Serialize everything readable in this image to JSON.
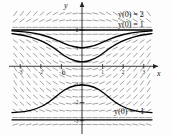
{
  "figure": {
    "title": "",
    "axis_labels": {
      "x": "x",
      "y": "y"
    },
    "origin_label": "0"
  },
  "annotations": [
    {
      "id": "ic-2",
      "text": "y(0) = 2"
    },
    {
      "id": "ic-1",
      "text": "y(0) = 1"
    },
    {
      "id": "ic-m1",
      "text": "y(0) = −1"
    }
  ],
  "chart_data": {
    "type": "line",
    "title": "",
    "xlabel": "x",
    "ylabel": "y",
    "xlim": [
      -3.4,
      3.4
    ],
    "ylim": [
      -3.4,
      3.1
    ],
    "grid": false,
    "legend_position": "right-inline",
    "xticks": [
      -3,
      -2,
      -1,
      0,
      1,
      2,
      3
    ],
    "yticks": [
      -3,
      -2,
      -1,
      1,
      2
    ],
    "xtick_labels": [
      "-3",
      "-2",
      "-1",
      "0",
      "1",
      "2",
      "3"
    ],
    "ytick_labels": [
      "-3",
      "-2",
      "-1",
      "1",
      "2"
    ],
    "background_field": {
      "kind": "slope-field",
      "description": "short dashes showing dy/dx at a grid of points",
      "nx": 21,
      "ny": 17,
      "stroke": "#555555"
    },
    "series": [
      {
        "name": "y(0) = 2",
        "label": "y(0) = 2",
        "color": "#000000",
        "x": [
          -3.4,
          -2.8,
          -2.2,
          -1.6,
          -1.0,
          -0.5,
          0.0,
          0.5,
          1.0,
          1.6,
          2.2,
          2.8,
          3.4
        ],
        "values": [
          2.0,
          2.0,
          2.0,
          2.0,
          2.0,
          2.0,
          2.0,
          2.0,
          2.0,
          2.0,
          2.0,
          2.0,
          2.0
        ]
      },
      {
        "name": "y(0) = 1",
        "label": "y(0) = 1",
        "color": "#000000",
        "x": [
          -3.4,
          -2.8,
          -2.2,
          -1.6,
          -1.1,
          -0.6,
          0.0,
          0.6,
          1.1,
          1.6,
          2.2,
          2.8,
          3.4
        ],
        "values": [
          1.95,
          1.9,
          1.8,
          1.62,
          1.38,
          1.12,
          1.0,
          1.12,
          1.38,
          1.62,
          1.8,
          1.9,
          1.95
        ]
      },
      {
        "name": "lower-branch",
        "label": "",
        "color": "#000000",
        "x": [
          -3.4,
          -2.8,
          -2.2,
          -1.6,
          -1.1,
          -0.6,
          0.0,
          0.6,
          1.1,
          1.6,
          2.2,
          2.8,
          3.4
        ],
        "values": [
          1.8,
          1.7,
          1.52,
          1.2,
          0.78,
          0.38,
          0.2,
          0.38,
          0.78,
          1.2,
          1.52,
          1.7,
          1.8
        ]
      },
      {
        "name": "y(0) = −1",
        "label": "y(0) = −1",
        "color": "#000000",
        "x": [
          -3.4,
          -2.8,
          -2.2,
          -1.6,
          -1.1,
          -0.6,
          0.0,
          0.6,
          1.1,
          1.6,
          2.2,
          2.8,
          3.4
        ],
        "values": [
          -2.55,
          -2.5,
          -2.35,
          -2.0,
          -1.5,
          -1.12,
          -1.0,
          -1.12,
          -1.5,
          -2.0,
          -2.35,
          -2.5,
          -2.55
        ]
      },
      {
        "name": "bottom-asymptote",
        "label": "",
        "color": "#000000",
        "x": [
          -3.4,
          -2.0,
          0.0,
          2.0,
          3.4
        ],
        "values": [
          -2.95,
          -2.95,
          -2.95,
          -2.95,
          -2.95
        ]
      }
    ]
  }
}
